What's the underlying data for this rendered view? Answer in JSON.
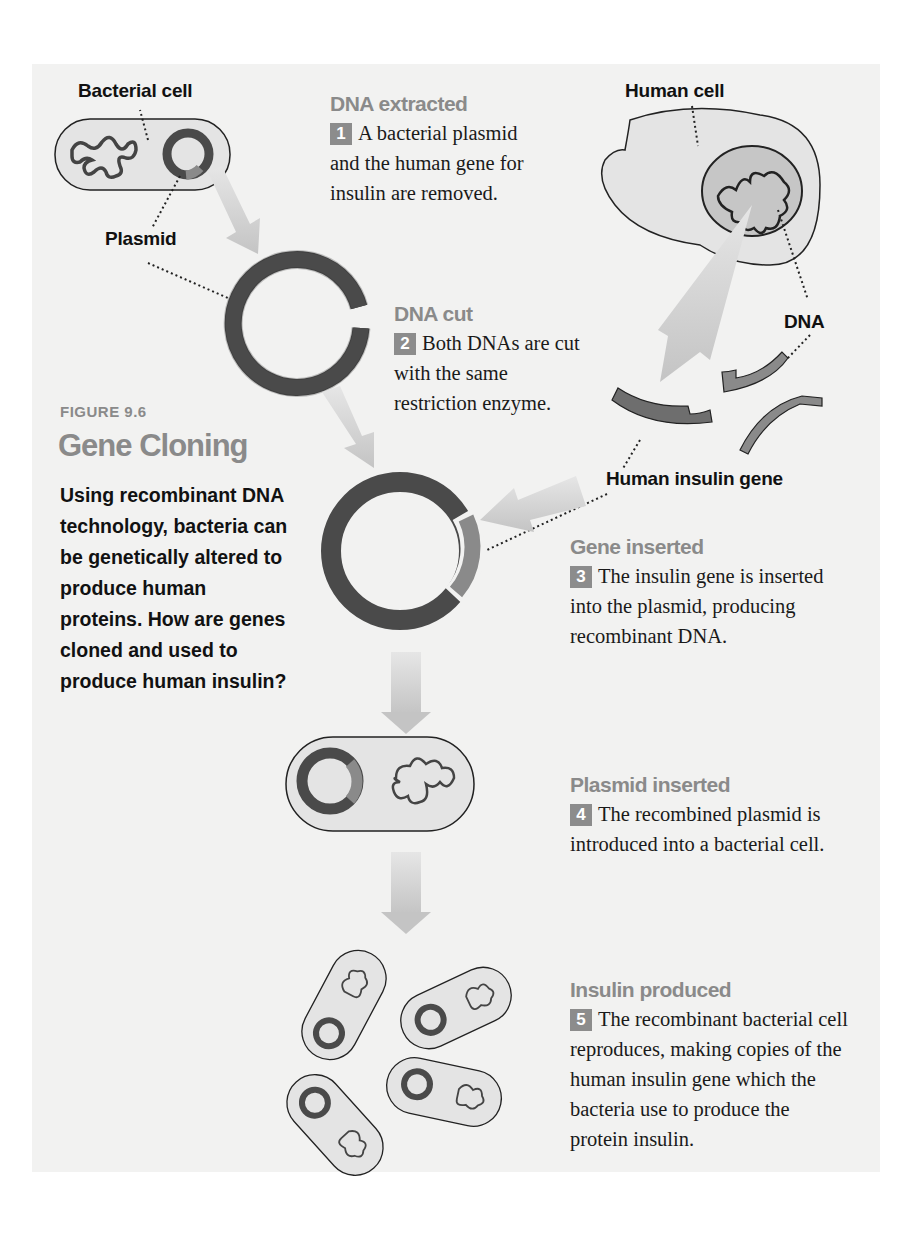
{
  "figure": {
    "number": "FIGURE 9.6",
    "title": "Gene Cloning",
    "caption": "Using recombinant DNA technology, bacteria can be genetically altered to produce human proteins. How are genes cloned and used to produce human insulin?"
  },
  "labels": {
    "bacterial_cell": "Bacterial cell",
    "plasmid": "Plasmid",
    "human_cell": "Human cell",
    "dna": "DNA",
    "human_insulin_gene": "Human insulin gene"
  },
  "steps": [
    {
      "number": "1",
      "title": "DNA extracted",
      "text": "A bacterial plasmid and the human gene for insulin are removed."
    },
    {
      "number": "2",
      "title": "DNA cut",
      "text": "Both DNAs are cut with the same restriction enzyme."
    },
    {
      "number": "3",
      "title": "Gene inserted",
      "text": "The insulin gene is inserted into the plasmid, producing recombinant DNA."
    },
    {
      "number": "4",
      "title": "Plasmid inserted",
      "text": "The recombined plasmid is introduced into a bacterial cell."
    },
    {
      "number": "5",
      "title": "Insulin produced",
      "text": "The recombinant bacterial cell reproduces, making copies of the human insulin gene which the bacteria use to produce the protein insulin."
    }
  ],
  "colors": {
    "panel_bg": "#f2f2f1",
    "plasmid_dark": "#4a4a4a",
    "insulin_gene": "#8a8a8a",
    "arrow": "#cfcfcf",
    "heading_gray": "#8a8a8a",
    "cell_fill": "#e4e4e4"
  }
}
